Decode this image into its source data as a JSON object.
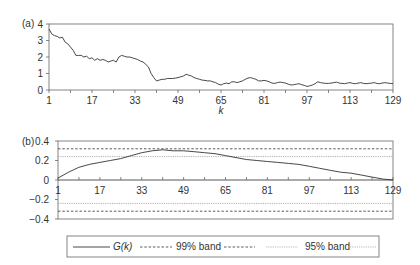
{
  "chart_data": [
    {
      "type": "line",
      "panel_label": "(a)",
      "title": "",
      "xlabel": "k",
      "ylabel": "",
      "xlim": [
        1,
        129
      ],
      "ylim": [
        0,
        4
      ],
      "grid": false,
      "x_ticks": [
        1,
        17,
        33,
        49,
        65,
        81,
        97,
        113,
        129
      ],
      "x_tick_labels": [
        "1",
        "17",
        "33",
        "49",
        "65",
        "81",
        "97",
        "113",
        "129"
      ],
      "y_ticks": [
        0,
        1,
        2,
        3,
        4
      ],
      "y_tick_labels": [
        "0",
        "1",
        "2",
        "3",
        "4"
      ],
      "series": [
        {
          "name": "series",
          "color": "#333333",
          "x": [
            1,
            2,
            3,
            4,
            5,
            6,
            7,
            8,
            9,
            10,
            11,
            12,
            13,
            14,
            15,
            16,
            17,
            18,
            19,
            20,
            21,
            22,
            23,
            24,
            25,
            26,
            27,
            28,
            29,
            30,
            31,
            32,
            33,
            34,
            35,
            36,
            37,
            38,
            39,
            40,
            41,
            42,
            43,
            44,
            45,
            46,
            47,
            48,
            49,
            50,
            51,
            52,
            53,
            54,
            55,
            56,
            57,
            58,
            59,
            60,
            61,
            62,
            63,
            64,
            65,
            66,
            67,
            68,
            69,
            70,
            71,
            72,
            73,
            74,
            75,
            76,
            77,
            78,
            79,
            80,
            81,
            82,
            83,
            84,
            85,
            86,
            87,
            88,
            89,
            90,
            91,
            92,
            93,
            94,
            95,
            96,
            97,
            98,
            99,
            100,
            101,
            102,
            103,
            104,
            105,
            106,
            107,
            108,
            109,
            110,
            111,
            112,
            113,
            114,
            115,
            116,
            117,
            118,
            119,
            120,
            121,
            122,
            123,
            124,
            125,
            126,
            127,
            128,
            129
          ],
          "values": [
            3.7,
            3.4,
            3.3,
            3.25,
            3.15,
            3.2,
            2.9,
            2.8,
            2.6,
            2.4,
            2.1,
            2.1,
            2.1,
            2.0,
            2.05,
            1.9,
            1.95,
            1.8,
            1.9,
            1.8,
            1.85,
            1.8,
            1.7,
            1.75,
            1.8,
            1.7,
            2.0,
            2.1,
            2.05,
            2.0,
            2.0,
            1.95,
            1.9,
            1.85,
            1.75,
            1.7,
            1.55,
            1.4,
            1.0,
            0.75,
            0.55,
            0.6,
            0.65,
            0.65,
            0.7,
            0.7,
            0.7,
            0.72,
            0.75,
            0.8,
            0.85,
            0.95,
            0.9,
            0.85,
            0.75,
            0.7,
            0.65,
            0.6,
            0.58,
            0.55,
            0.55,
            0.5,
            0.45,
            0.35,
            0.3,
            0.38,
            0.42,
            0.38,
            0.5,
            0.5,
            0.45,
            0.5,
            0.55,
            0.65,
            0.72,
            0.75,
            0.7,
            0.65,
            0.55,
            0.55,
            0.58,
            0.55,
            0.5,
            0.42,
            0.4,
            0.45,
            0.48,
            0.45,
            0.42,
            0.35,
            0.3,
            0.32,
            0.35,
            0.38,
            0.32,
            0.28,
            0.22,
            0.25,
            0.3,
            0.38,
            0.5,
            0.45,
            0.42,
            0.4,
            0.4,
            0.42,
            0.45,
            0.48,
            0.42,
            0.4,
            0.38,
            0.42,
            0.45,
            0.4,
            0.38,
            0.42,
            0.45,
            0.4,
            0.38,
            0.4,
            0.42,
            0.45,
            0.4,
            0.38,
            0.42,
            0.45,
            0.42,
            0.4,
            0.38
          ]
        }
      ]
    },
    {
      "type": "line",
      "panel_label": "(b)",
      "title": "",
      "xlabel": "",
      "ylabel": "",
      "xlim": [
        1,
        129
      ],
      "ylim": [
        -0.4,
        0.4
      ],
      "grid": false,
      "x_ticks": [
        1,
        17,
        33,
        49,
        65,
        81,
        97,
        113,
        129
      ],
      "x_tick_labels": [
        "1",
        "17",
        "33",
        "49",
        "65",
        "81",
        "97",
        "113",
        "129"
      ],
      "y_ticks": [
        -0.4,
        -0.2,
        0,
        0.2,
        0.4
      ],
      "y_tick_labels": [
        "-0.4",
        "-0.2",
        "0",
        "0.2",
        "0.4"
      ],
      "series": [
        {
          "name": "G(k)",
          "style": "solid",
          "color": "#333333",
          "x": [
            1,
            5,
            9,
            13,
            17,
            21,
            25,
            29,
            33,
            37,
            41,
            45,
            49,
            53,
            57,
            61,
            65,
            69,
            73,
            77,
            81,
            85,
            89,
            93,
            97,
            101,
            105,
            109,
            113,
            117,
            121,
            125,
            129
          ],
          "values": [
            0.02,
            0.08,
            0.13,
            0.16,
            0.18,
            0.2,
            0.22,
            0.25,
            0.28,
            0.3,
            0.31,
            0.3,
            0.3,
            0.29,
            0.28,
            0.27,
            0.25,
            0.23,
            0.21,
            0.2,
            0.19,
            0.18,
            0.17,
            0.16,
            0.14,
            0.12,
            0.1,
            0.08,
            0.07,
            0.05,
            0.03,
            0.01,
            0.0
          ]
        },
        {
          "name": "99% band",
          "style": "dashed",
          "color": "#333333",
          "upper": 0.32,
          "lower": -0.32
        },
        {
          "name": "95% band",
          "style": "dotted",
          "color": "#777777",
          "upper": 0.24,
          "lower": -0.24
        }
      ],
      "legend": {
        "position": "bottom",
        "entries": [
          "G(k)",
          "99% band",
          "95% band"
        ]
      }
    }
  ],
  "panels": {
    "a": {
      "label": "(a)",
      "xlabel": "k"
    },
    "b": {
      "label": "(b)"
    }
  },
  "legend": {
    "g_label": "G(k)",
    "band99_label": "99% band",
    "band95_label": "95% band"
  }
}
